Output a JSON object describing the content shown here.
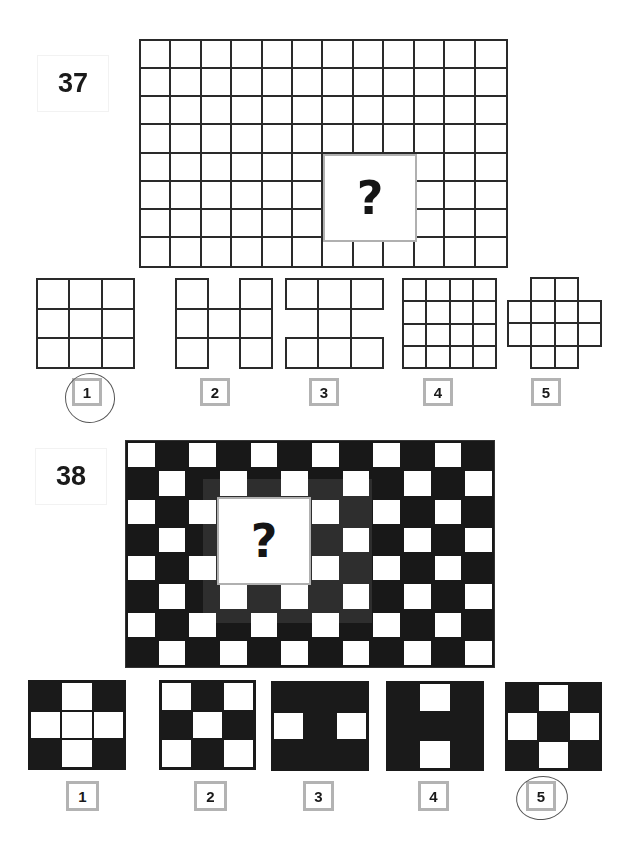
{
  "puzzles": [
    {
      "number": "37",
      "question_mark": "?",
      "grid": {
        "cols": 12,
        "rows": 8,
        "missing": {
          "col_start": 6,
          "row_start": 4,
          "cols": 3,
          "rows": 3
        }
      },
      "options": [
        {
          "label": "1",
          "shape": "3x3 full grid",
          "selected": true
        },
        {
          "label": "2",
          "shape": "H shape"
        },
        {
          "label": "3",
          "shape": "I shape"
        },
        {
          "label": "4",
          "shape": "4x4 full grid"
        },
        {
          "label": "5",
          "shape": "plus shape 4x4 without corners"
        }
      ]
    },
    {
      "number": "38",
      "question_mark": "?",
      "grid": {
        "cols": 12,
        "rows": 8,
        "pattern": "checkerboard",
        "first_cell": "white"
      },
      "options": [
        {
          "label": "1",
          "cells": [
            "B",
            "W",
            "B",
            "W",
            "W",
            "W",
            "B",
            "W",
            "B"
          ]
        },
        {
          "label": "2",
          "cells": [
            "W",
            "B",
            "W",
            "B",
            "W",
            "B",
            "W",
            "B",
            "W"
          ]
        },
        {
          "label": "3",
          "cells": [
            "B",
            "B",
            "B",
            "W",
            "B",
            "W",
            "B",
            "B",
            "B"
          ]
        },
        {
          "label": "4",
          "cells": [
            "B",
            "W",
            "B",
            "B",
            "B",
            "B",
            "B",
            "W",
            "B"
          ]
        },
        {
          "label": "5",
          "cells": [
            "B",
            "W",
            "B",
            "W",
            "B",
            "W",
            "B",
            "W",
            "B"
          ],
          "selected": true
        }
      ]
    }
  ],
  "colors": {
    "line": "#2a2a2a",
    "dark": "#181818",
    "label_border": "#b3b3b3",
    "qbox_border": "#b0b0b0"
  }
}
